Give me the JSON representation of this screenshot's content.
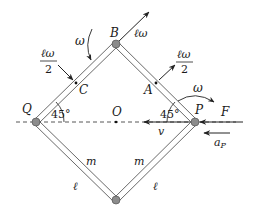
{
  "diagram": {
    "type": "mechanics-rhombus-linkage",
    "points": {
      "B": {
        "label": "B"
      },
      "A": {
        "label": "A"
      },
      "C": {
        "label": "C"
      },
      "Q": {
        "label": "Q"
      },
      "O": {
        "label": "O"
      },
      "P": {
        "label": "P"
      }
    },
    "angles": {
      "left": "45°",
      "right": "45°"
    },
    "rods": {
      "mass_label": "m",
      "length_label": "ℓ"
    },
    "vectors": {
      "B_velocity": "ℓω",
      "A_velocity_num": "ℓω",
      "A_velocity_den": "2",
      "C_velocity_num": "ℓω",
      "C_velocity_den": "2",
      "P_velocity": "v",
      "force": "F",
      "accel": "a",
      "accel_sub": "P"
    },
    "rotation": {
      "left_omega": "ω",
      "right_omega": "ω"
    },
    "colors": {
      "stroke": "#333333",
      "joint_fill": "#8c8c8c",
      "joint_stroke": "#555555"
    }
  }
}
